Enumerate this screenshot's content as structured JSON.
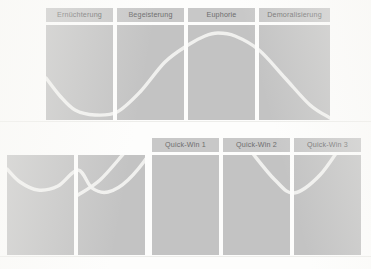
{
  "figure": {
    "background_color": "#fdfdfc",
    "panel_color": "#c3c3c3",
    "label_chip_color": "#c8c8c8",
    "label_text_color": "#6d6d6d",
    "curve_color": "#f2f2f0",
    "baseline_color": "#ededea"
  },
  "top_section": {
    "labels": [
      {
        "text": "Ernüchterung",
        "x": 46,
        "width": 67
      },
      {
        "text": "Begeisterung",
        "x": 117,
        "width": 67
      },
      {
        "text": "Euphorie",
        "x": 188,
        "width": 67
      },
      {
        "text": "Demoralisierung",
        "x": 259,
        "width": 71
      }
    ],
    "panels": [
      {
        "x": 46,
        "width": 67
      },
      {
        "x": 117,
        "width": 67
      },
      {
        "x": 188,
        "width": 67
      },
      {
        "x": 259,
        "width": 71
      }
    ]
  },
  "bottom_section": {
    "labels": [
      {
        "text": "Quick-Win 1",
        "x": 152,
        "width": 67
      },
      {
        "text": "Quick-Win 2",
        "x": 223,
        "width": 67
      },
      {
        "text": "Quick-Win 3",
        "x": 294,
        "width": 67
      }
    ],
    "panels": [
      {
        "x": 7,
        "width": 67
      },
      {
        "x": 78,
        "width": 67
      },
      {
        "x": 152,
        "width": 67
      },
      {
        "x": 223,
        "width": 67
      },
      {
        "x": 294,
        "width": 67
      }
    ]
  },
  "chart_data": {
    "type": "line",
    "xlabel": "",
    "ylabel": "",
    "grid": false,
    "legend": "none",
    "charts": [
      {
        "name": "top-curve",
        "description": "Single S-shaped change curve: dips through Ernüchterung, rises through Begeisterung, peaks in Euphorie, falls through Demoralisierung",
        "categories": [
          "Ernüchterung",
          "Begeisterung",
          "Euphorie",
          "Demoralisierung"
        ],
        "x": [
          46,
          60,
          75,
          95,
          117,
          140,
          165,
          188,
          205,
          218,
          235,
          259,
          285,
          310,
          330
        ],
        "y": [
          78,
          96,
          110,
          115,
          112,
          92,
          62,
          45,
          36,
          33,
          36,
          50,
          78,
          105,
          118
        ],
        "xlim": [
          46,
          330
        ],
        "ylim": [
          25,
          120
        ]
      },
      {
        "name": "bottom-curve",
        "description": "Repeating oscillating change curve spanning five panels with three Quick-Win peaks",
        "categories": [
          "",
          "",
          "Quick-Win 1",
          "Quick-Win 2",
          "Quick-Win 3"
        ],
        "x": [
          7,
          20,
          38,
          58,
          78,
          92,
          108,
          128,
          152,
          168,
          185,
          205,
          223,
          240,
          258,
          278,
          294,
          312,
          330,
          348,
          361
        ],
        "y": [
          169,
          182,
          190,
          186,
          170,
          188,
          192,
          180,
          150,
          118,
          100,
          98,
          112,
          100,
          98,
          108,
          120,
          102,
          96,
          100,
          110
        ],
        "xlim": [
          7,
          361
        ],
        "ylim": [
          90,
          195
        ]
      },
      {
        "name": "bottom-curve-secondary",
        "description": "Second interleaved rising curve crossing the first between panels",
        "x": [
          78,
          100,
          125,
          152,
          175,
          200,
          223,
          250,
          275,
          294,
          320,
          345,
          361
        ],
        "y": [
          195,
          180,
          152,
          120,
          100,
          96,
          115,
          150,
          180,
          193,
          175,
          140,
          118
        ],
        "xlim": [
          78,
          361
        ],
        "ylim": [
          90,
          198
        ]
      }
    ]
  }
}
